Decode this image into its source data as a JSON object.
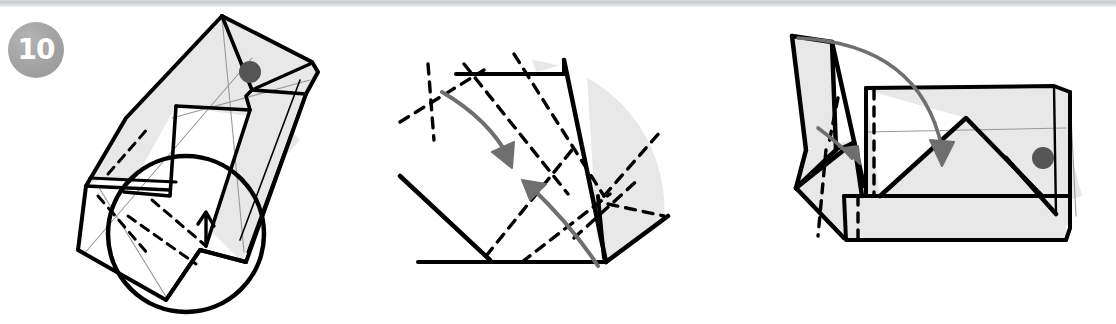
{
  "page": {
    "width": 1116,
    "height": 324,
    "background": "#ffffff",
    "top_strip_color": "#cbccce",
    "caption": ""
  },
  "badge": {
    "number": "10",
    "fill": "#a2a2a2",
    "text_color": "#ffffff",
    "name": "step-number-badge"
  },
  "style": {
    "stroke": "#000000",
    "stroke_light": "#9a9a9a",
    "face_fill": "#e8e8e8",
    "face_fill_white": "#ffffff",
    "arrow_color": "#6f6f6f",
    "dot_color": "#555555",
    "dash_pattern": "9 7"
  },
  "panels": [
    {
      "id": "panel-left",
      "label": "Folded model with magnifier detail",
      "has_magnifier": true,
      "markers": [
        {
          "name": "reference-dot",
          "x": 250,
          "y": 72,
          "r": 11
        }
      ]
    },
    {
      "id": "panel-middle",
      "label": "Close-up of crease pattern with two fold arrows",
      "arrows": [
        {
          "name": "fold-arrow-down",
          "direction": "down"
        },
        {
          "name": "fold-arrow-up",
          "direction": "up-left"
        }
      ]
    },
    {
      "id": "panel-right",
      "label": "Open box form with flaps and fold arrows",
      "arrows": [
        {
          "name": "fold-arrow-large",
          "direction": "down"
        },
        {
          "name": "fold-arrow-small",
          "direction": "down-right"
        }
      ],
      "markers": [
        {
          "name": "reference-dot",
          "x": 1043,
          "y": 178,
          "r": 11
        }
      ]
    }
  ]
}
